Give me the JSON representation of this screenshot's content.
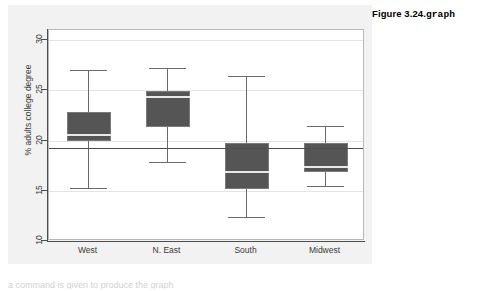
{
  "figure": {
    "caption_prefix": "Figure 3.24.",
    "caption_command": "graph"
  },
  "bottom_note": {
    "text": "a command is given to produce the graph"
  },
  "colors": {
    "box_fill": "#555555",
    "box_border": "#7a7a7a",
    "median": "#e8e8e8",
    "whisker": "#6a6a6a",
    "axis": "#4d4d4d",
    "gridline": "#e4e4e4",
    "plot_background": "#ffffff",
    "graph_background": "#f2f2f2",
    "reference_line": "#4d4d4d"
  },
  "chart_data": {
    "type": "box",
    "title": "",
    "xlabel": "",
    "ylabel": "% adults college degree",
    "ylim": [
      10,
      31
    ],
    "yticks": [
      10,
      15,
      20,
      25,
      30
    ],
    "ytick_labels": [
      "10",
      "15",
      "20",
      "25",
      "30"
    ],
    "grid": true,
    "legend": "none",
    "categories": [
      "West",
      "N. East",
      "South",
      "Midwest"
    ],
    "reference_line": {
      "value": 19.3,
      "orientation": "horizontal",
      "label": ""
    },
    "boxes": [
      {
        "category": "West",
        "whisker_low": 15.3,
        "q1": 19.9,
        "median": 20.6,
        "q3": 22.8,
        "whisker_high": 27.0,
        "outliers": []
      },
      {
        "category": "N. East",
        "whisker_low": 17.9,
        "q1": 21.3,
        "median": 24.3,
        "q3": 24.9,
        "whisker_high": 27.2,
        "outliers": []
      },
      {
        "category": "South",
        "whisker_low": 12.4,
        "q1": 15.2,
        "median": 16.9,
        "q3": 19.8,
        "whisker_high": 26.4,
        "outliers": []
      },
      {
        "category": "Midwest",
        "whisker_low": 15.5,
        "q1": 16.9,
        "median": 17.4,
        "q3": 19.8,
        "whisker_high": 21.5,
        "outliers": []
      }
    ]
  }
}
